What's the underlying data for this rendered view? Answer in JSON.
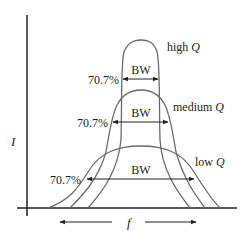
{
  "diagram": {
    "type": "resonance-curves",
    "y_axis_label": "I",
    "x_axis_label": "f",
    "curves": [
      {
        "name": "high Q",
        "label_text": "high ",
        "q_symbol": "Q",
        "percent_label": "70.7%",
        "bw_label": "BW"
      },
      {
        "name": "medium Q",
        "label_text": "medium ",
        "q_symbol": "Q",
        "percent_label": "70.7%",
        "bw_label": "BW"
      },
      {
        "name": "low Q",
        "label_text": "low ",
        "q_symbol": "Q",
        "percent_label": "70.7%",
        "bw_label": "BW"
      }
    ],
    "colors": {
      "curve": "#6b6b6b",
      "axis": "#222222",
      "arrow": "#222222"
    }
  }
}
